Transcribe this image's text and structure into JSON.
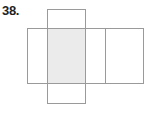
{
  "problem": {
    "number": "38."
  },
  "net": {
    "description": "Net of a rectangular prism",
    "colors": {
      "line": "#9a9a9a",
      "shade": "#ebebeb",
      "background": "#ffffff"
    },
    "faces": [
      {
        "id": "top",
        "x": 47,
        "y": 9,
        "w": 38,
        "h": 19,
        "shaded": false
      },
      {
        "id": "left",
        "x": 27,
        "y": 28,
        "w": 20,
        "h": 55,
        "shaded": false
      },
      {
        "id": "front",
        "x": 47,
        "y": 28,
        "w": 38,
        "h": 55,
        "shaded": true
      },
      {
        "id": "right",
        "x": 85,
        "y": 28,
        "w": 20,
        "h": 55,
        "shaded": false
      },
      {
        "id": "back",
        "x": 105,
        "y": 28,
        "w": 38,
        "h": 55,
        "shaded": false
      },
      {
        "id": "bottom",
        "x": 47,
        "y": 83,
        "w": 38,
        "h": 20,
        "shaded": false
      }
    ]
  }
}
